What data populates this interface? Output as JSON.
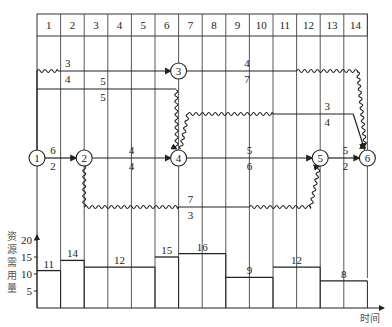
{
  "timescale": {
    "columns": [
      "1",
      "2",
      "3",
      "4",
      "5",
      "6",
      "7",
      "8",
      "9",
      "10",
      "11",
      "12",
      "13",
      "14"
    ]
  },
  "nodes": [
    {
      "id": "1",
      "label": "1"
    },
    {
      "id": "2",
      "label": "2"
    },
    {
      "id": "3",
      "label": "3"
    },
    {
      "id": "4",
      "label": "4"
    },
    {
      "id": "5",
      "label": "5"
    },
    {
      "id": "6",
      "label": "6"
    }
  ],
  "activities": [
    {
      "from": "1",
      "to": "2",
      "resource": "6",
      "duration": "2"
    },
    {
      "from": "1",
      "to": "3",
      "resource": "3",
      "duration": "4"
    },
    {
      "from": "1",
      "to": "4",
      "resource": "5",
      "duration": "5"
    },
    {
      "from": "2",
      "to": "4",
      "resource": "4",
      "duration": "4"
    },
    {
      "from": "2",
      "to": "5",
      "resource": "7",
      "duration": "3"
    },
    {
      "from": "3",
      "to": "6",
      "resource": "4",
      "duration": "7"
    },
    {
      "from": "4",
      "to": "5",
      "resource": "5",
      "duration": "6"
    },
    {
      "from": "4",
      "to": "6",
      "resource": "3",
      "duration": "4"
    },
    {
      "from": "5",
      "to": "6",
      "resource": "5",
      "duration": "2"
    }
  ],
  "histogram": {
    "y_axis_label": [
      "资",
      "源",
      "需",
      "用",
      "量"
    ],
    "x_axis_label": "时间",
    "y_ticks": [
      "5",
      "10",
      "15",
      "20"
    ],
    "segments": [
      {
        "start": 0,
        "end": 1,
        "value": "11"
      },
      {
        "start": 1,
        "end": 2,
        "value": "14"
      },
      {
        "start": 2,
        "end": 5,
        "value": "12"
      },
      {
        "start": 5,
        "end": 6,
        "value": "15"
      },
      {
        "start": 6,
        "end": 8,
        "value": "16"
      },
      {
        "start": 8,
        "end": 10,
        "value": "9"
      },
      {
        "start": 10,
        "end": 12,
        "value": "12"
      },
      {
        "start": 12,
        "end": 14,
        "value": "8"
      }
    ]
  }
}
